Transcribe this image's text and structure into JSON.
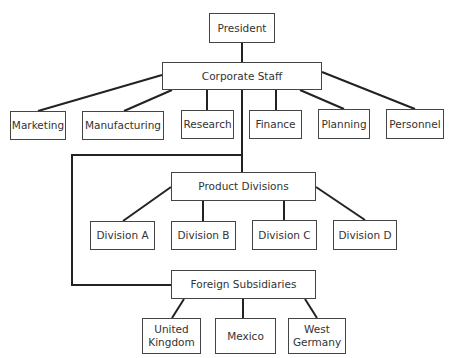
{
  "chart": {
    "root": "President",
    "level1": "Corporate Staff",
    "staff_functions": [
      "Marketing",
      "Manufacturing",
      "Research",
      "Finance",
      "Planning",
      "Personnel"
    ],
    "product_group": "Product Divisions",
    "divisions": [
      "Division A",
      "Division B",
      "Division C",
      "Division D"
    ],
    "foreign_group": "Foreign Subsidiaries",
    "subsidiaries": [
      "United Kingdom",
      "Mexico",
      "West Germany"
    ]
  },
  "colors": {
    "line": "#222222",
    "border": "#444444",
    "text": "#333333",
    "background": "#ffffff"
  }
}
